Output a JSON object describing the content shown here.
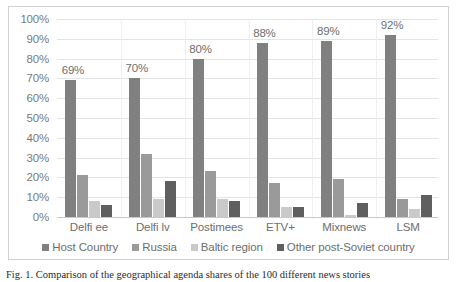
{
  "chart_data": {
    "type": "bar",
    "title": "",
    "xlabel": "",
    "ylabel": "",
    "ylim": [
      0,
      100
    ],
    "ytick_labels": [
      "100%",
      "90%",
      "80%",
      "70%",
      "60%",
      "50%",
      "40%",
      "30%",
      "20%",
      "10%",
      "0%"
    ],
    "ytick_values": [
      100,
      90,
      80,
      70,
      60,
      50,
      40,
      30,
      20,
      10,
      0
    ],
    "grid": true,
    "legend_position": "bottom",
    "categories": [
      "Delfi ee",
      "Delfi lv",
      "Postimees",
      "ETV+",
      "Mixnews",
      "LSM"
    ],
    "series": [
      {
        "name": "Host Country",
        "color": "#808080",
        "values": [
          69,
          70,
          80,
          88,
          89,
          92
        ]
      },
      {
        "name": "Russia",
        "color": "#9a9a9a",
        "values": [
          21,
          32,
          23,
          17,
          19,
          9
        ]
      },
      {
        "name": "Baltic region",
        "color": "#cacaca",
        "values": [
          8,
          9,
          9,
          5,
          1,
          4
        ]
      },
      {
        "name": "Other post-Soviet country",
        "color": "#5f5f5f",
        "values": [
          6,
          18,
          8,
          5,
          7,
          11
        ]
      }
    ],
    "data_labels": [
      "69%",
      "70%",
      "80%",
      "88%",
      "89%",
      "92%"
    ],
    "data_labels_series": "Host Country"
  },
  "caption": {
    "text": "Fig. 1. Comparison of the geographical agenda shares of the 100 different news stories"
  }
}
